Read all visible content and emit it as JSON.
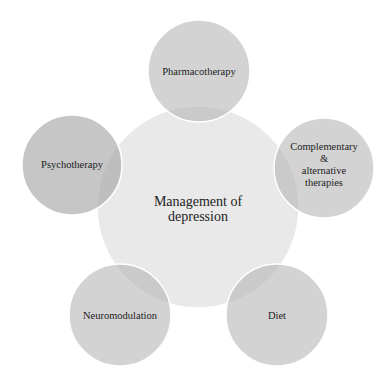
{
  "diagram": {
    "type": "radial-venn",
    "center": {
      "label_line1": "Management of",
      "label_line2": "depression",
      "cx": 198,
      "cy": 207,
      "r": 101,
      "fill": "#e8e8e8"
    },
    "satellites": [
      {
        "id": "pharmacotherapy",
        "lines": [
          "Pharmacotherapy"
        ],
        "cx": 199,
        "cy": 71,
        "r": 51
      },
      {
        "id": "complementary",
        "lines": [
          "Complementary &",
          "alternative",
          "therapies"
        ],
        "cx": 324,
        "cy": 168,
        "r": 50
      },
      {
        "id": "diet",
        "lines": [
          "Diet"
        ],
        "cx": 277,
        "cy": 315,
        "r": 51
      },
      {
        "id": "neuromodulation",
        "lines": [
          "Neuromodulation"
        ],
        "cx": 120,
        "cy": 315,
        "r": 51
      },
      {
        "id": "psychotherapy",
        "lines": [
          "Psychotherapy"
        ],
        "cx": 72,
        "cy": 165,
        "r": 50
      }
    ],
    "colors": {
      "satellite_fill": "#b8b8b8",
      "satellite_opacity": "0.6",
      "stroke": "#ffffff"
    }
  }
}
